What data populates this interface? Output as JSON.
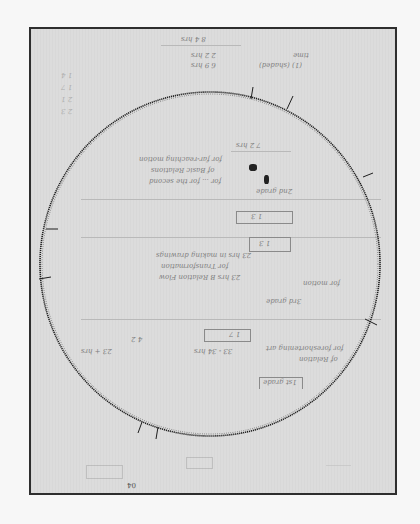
{
  "document": {
    "type": "scanned handwritten sheet with circular inscription",
    "orientation": "notes written upside down",
    "colors": {
      "page_background": "#f7f7f7",
      "paper": "#dcdcdc",
      "frame": "#2e2e2e",
      "ink_inscription": "#1e1e1e",
      "ink_notes": "#6e6e6e"
    }
  },
  "inscription": {
    "shape": "circle",
    "center": [
      208,
      260
    ],
    "radius": 170,
    "text": "…THECECTMANA…",
    "visible_fragment": "THECECTMANA"
  },
  "notes": {
    "top_header": "8 4 hrs",
    "top_line_1": "2 2 hrs",
    "top_line_2": "6 9 hrs",
    "top_right_1": "time",
    "top_right_2": "(1) (shaded)",
    "center_total": "7 2 hrs",
    "center_lines": [
      "for far-reaching motion",
      "of Basic Relations",
      "for ... for the second"
    ],
    "section_label_2": "2nd grade",
    "boxed_value_1": "1 3",
    "boxed_value_2": "1 3",
    "middle_lines": [
      "23 hrs in making drawings",
      "for Transformation",
      "23 hrs B Relation Flow"
    ],
    "side_label": "for motion",
    "section_label_3": "3rd grade",
    "lower_box": "1 7",
    "lower_mid": "33 - 34 hrs",
    "lower_left": "4 2",
    "lower_left_2": "23 + hrs",
    "lower_right": "for foreshortening art",
    "lower_right_2": "of Relation",
    "bottom_label": "1st grade",
    "left_column": [
      "1 4",
      "1 7",
      "2 1",
      "2 3"
    ],
    "footer_mark": "04"
  }
}
